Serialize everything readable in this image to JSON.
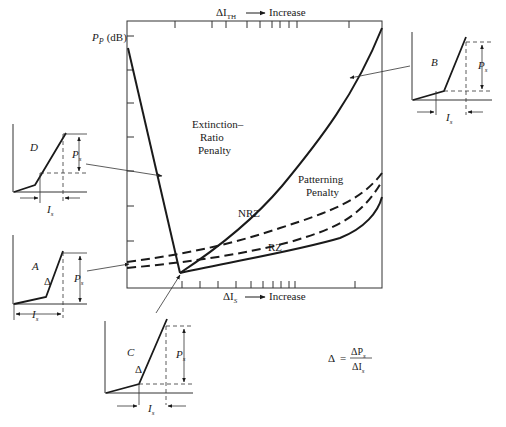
{
  "main_plot": {
    "y_axis_label": "P",
    "y_axis_label_sub": "P",
    "y_axis_unit": "(dB)",
    "top_axis_label": "ΔI",
    "top_axis_label_sub": "TH",
    "top_axis_arrow_text": "Increase",
    "bottom_axis_label": "ΔI",
    "bottom_axis_label_sub": "S",
    "bottom_axis_arrow_text": "Increase",
    "extinction_label_line1": "Extinction–",
    "extinction_label_line2": "Ratio",
    "extinction_label_line3": "Penalty",
    "patterning_label_line1": "Patterning",
    "patterning_label_line2": "Penalty",
    "nrz_label": "NRZ",
    "rz_label": "RZ"
  },
  "insets": {
    "A": {
      "label": "A",
      "delta": "Δ",
      "ps": "P",
      "ps_sub": "s",
      "is": "I",
      "is_sub": "s"
    },
    "B": {
      "label": "B",
      "ps": "P",
      "ps_sub": "s",
      "is": "I",
      "is_sub": "s"
    },
    "C": {
      "label": "C",
      "delta": "Δ",
      "ps": "P",
      "ps_sub": "s",
      "is": "I",
      "is_sub": "s"
    },
    "D": {
      "label": "D",
      "ps": "P",
      "ps_sub": "s",
      "is": "I",
      "is_sub": "s"
    }
  },
  "formula": {
    "lhs": "Δ",
    "equals": "=",
    "numerator": "ΔP",
    "numerator_sub": "s",
    "denominator": "ΔI",
    "denominator_sub": "s"
  },
  "colors": {
    "ink": "#1a1a1a",
    "background": "#ffffff"
  }
}
